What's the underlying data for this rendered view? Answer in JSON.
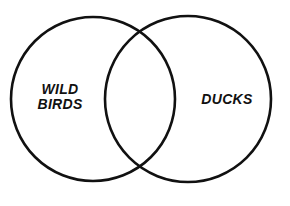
{
  "diagram": {
    "type": "venn",
    "sets": [
      {
        "id": "left",
        "label_lines": [
          "WILD",
          "BIRDS"
        ]
      },
      {
        "id": "right",
        "label_lines": [
          "DUCKS"
        ]
      }
    ],
    "intersection_label": "",
    "colors": {
      "stroke": "#111111",
      "background": "#ffffff"
    }
  }
}
